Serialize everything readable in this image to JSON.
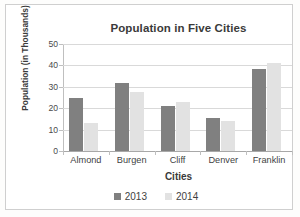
{
  "chart_data": {
    "type": "bar",
    "title": "Population in Five Cities",
    "xlabel": "Cities",
    "ylabel": "Population (in Thousands)",
    "categories": [
      "Almond",
      "Burgen",
      "Cliff",
      "Denver",
      "Franklin"
    ],
    "series": [
      {
        "name": "2013",
        "color": "#808080",
        "values": [
          25,
          32,
          21,
          15.5,
          38.5
        ]
      },
      {
        "name": "2014",
        "color": "#e2e2e2",
        "values": [
          13,
          27.5,
          23,
          14,
          41
        ]
      }
    ],
    "ylim": [
      0,
      50
    ],
    "yticks": [
      50,
      40,
      30,
      20,
      10,
      0
    ],
    "ytick_labels": [
      "50",
      "40",
      "30",
      "20",
      "10",
      "0"
    ],
    "grid": "horizontal",
    "legend_position": "bottom",
    "legend_entries": [
      "2013",
      "2014"
    ]
  }
}
